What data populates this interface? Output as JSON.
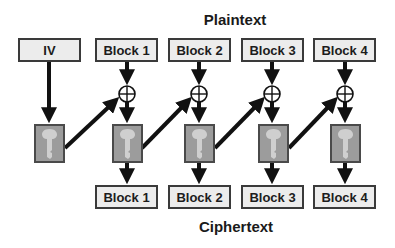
{
  "title_top": "Plaintext",
  "title_bottom": "Ciphertext",
  "iv": {
    "label": "IV"
  },
  "plaintext_blocks": [
    {
      "label": "Block 1"
    },
    {
      "label": "Block 2"
    },
    {
      "label": "Block 3"
    },
    {
      "label": "Block 4"
    }
  ],
  "ciphertext_blocks": [
    {
      "label": "Block 1"
    },
    {
      "label": "Block 2"
    },
    {
      "label": "Block 3"
    },
    {
      "label": "Block 4"
    }
  ],
  "icons": {
    "xor": "xor-circle-icon",
    "key": "key-icon"
  },
  "colors": {
    "box_fill": "#ececec",
    "box_border": "#3a3a3a",
    "key_box_fill": "#9c9c9c",
    "key_glyph": "#cfcfcf",
    "arrow": "#111111"
  }
}
